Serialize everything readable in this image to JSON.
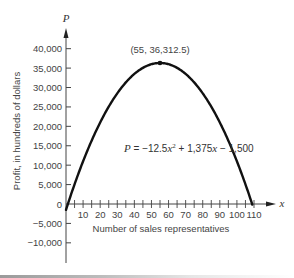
{
  "chart_data": {
    "type": "line",
    "title": "",
    "xlabel": "Number of sales representatives",
    "ylabel": "Profit, in hundreds of dollars",
    "x_axis_var": "x",
    "y_axis_var": "P",
    "equation": {
      "lhs": "P",
      "text": "P = −12.5x² + 1,375x − 1,500",
      "a": -12.5,
      "b": 1375,
      "c": -1500
    },
    "xlim": [
      0,
      110
    ],
    "ylim": [
      -12000,
      42000
    ],
    "x_ticks": [
      10,
      20,
      30,
      40,
      50,
      60,
      70,
      80,
      90,
      100,
      110
    ],
    "x_tick_labels": [
      "10",
      "20",
      "30",
      "40",
      "50",
      "60",
      "70",
      "80",
      "90",
      "100",
      "110"
    ],
    "x_minor_tick_step": 5,
    "y_ticks": [
      40000,
      35000,
      30000,
      25000,
      20000,
      15000,
      10000,
      5000,
      0,
      -5000,
      -10000
    ],
    "y_tick_labels": [
      "40,000",
      "35,000",
      "30,000",
      "25,000",
      "20,000",
      "15,000",
      "10,000",
      "5,000",
      "0",
      "−5,000",
      "−10,000"
    ],
    "series": [
      {
        "name": "P = −12.5x² + 1,375x − 1,500",
        "x": [
          0,
          1.1,
          10,
          20,
          30,
          40,
          50,
          55,
          60,
          70,
          80,
          90,
          100,
          108.9
        ],
        "values": [
          -1500,
          0,
          11000,
          21000,
          28500,
          33500,
          36000,
          36312.5,
          36000,
          33500,
          28500,
          21000,
          11000,
          0
        ]
      }
    ],
    "annotations": [
      {
        "type": "point",
        "x": 55,
        "y": 36312.5,
        "label": "(55, 36,312.5)"
      }
    ],
    "grid": false,
    "legend": null
  }
}
